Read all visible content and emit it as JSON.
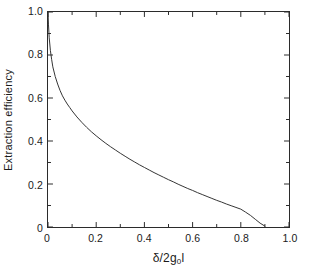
{
  "figure": {
    "background_color": "#ffffff",
    "frame_color": "#2b2b2b",
    "curve_color": "#333333"
  },
  "chart_data": {
    "type": "line",
    "title": "",
    "subtitle": "",
    "xlabel_parts": {
      "prefix": "δ/2g",
      "subscript": "0",
      "suffix": "l"
    },
    "xlabel": "δ/2g₀l",
    "ylabel": "Extraction efficiency",
    "xlim": [
      0,
      1.0
    ],
    "ylim": [
      0,
      1.0
    ],
    "grid": false,
    "legend": null,
    "legend_position": "none",
    "xticks": [
      0,
      0.2,
      0.4,
      0.6,
      0.8,
      1.0
    ],
    "xtick_labels": [
      "0",
      "0.2",
      "0.4",
      "0.6",
      "0.8",
      "1.0"
    ],
    "yticks": [
      0,
      0.2,
      0.4,
      0.6,
      0.8,
      1.0
    ],
    "ytick_labels": [
      "0",
      "0.2",
      "0.4",
      "0.6",
      "0.8",
      "1.0"
    ],
    "minor_xticks": [
      0.1,
      0.3,
      0.5,
      0.7,
      0.9
    ],
    "minor_yticks": [
      0.1,
      0.3,
      0.5,
      0.7,
      0.9
    ],
    "tick_direction": "in",
    "series": [
      {
        "name": "Extraction efficiency",
        "x": [
          0.0,
          0.002,
          0.005,
          0.01,
          0.015,
          0.02,
          0.03,
          0.04,
          0.05,
          0.06,
          0.07,
          0.08,
          0.09,
          0.1,
          0.12,
          0.14,
          0.16,
          0.18,
          0.2,
          0.22,
          0.24,
          0.26,
          0.28,
          0.3,
          0.32,
          0.34,
          0.36,
          0.38,
          0.4,
          0.42,
          0.44,
          0.46,
          0.48,
          0.5,
          0.52,
          0.54,
          0.56,
          0.58,
          0.6,
          0.62,
          0.64,
          0.66,
          0.68,
          0.7,
          0.72,
          0.74,
          0.76,
          0.78,
          0.8,
          0.82,
          0.84,
          0.86,
          0.88,
          0.9
        ],
        "y": [
          1.0,
          0.94,
          0.88,
          0.82,
          0.78,
          0.745,
          0.7,
          0.665,
          0.635,
          0.61,
          0.59,
          0.572,
          0.556,
          0.54,
          0.512,
          0.487,
          0.464,
          0.443,
          0.424,
          0.406,
          0.389,
          0.373,
          0.358,
          0.343,
          0.329,
          0.315,
          0.302,
          0.289,
          0.277,
          0.265,
          0.253,
          0.242,
          0.231,
          0.22,
          0.21,
          0.199,
          0.189,
          0.179,
          0.17,
          0.16,
          0.151,
          0.142,
          0.133,
          0.124,
          0.116,
          0.107,
          0.099,
          0.091,
          0.083,
          0.069,
          0.054,
          0.036,
          0.018,
          0.004
        ]
      }
    ]
  }
}
